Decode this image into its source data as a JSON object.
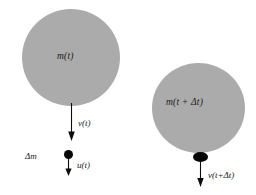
{
  "diagram": {
    "background_color": "#ffffff",
    "body_color": "#ababab",
    "mass_color": "#060606",
    "arrow_color": "#0d0d0d",
    "before": {
      "body_label": "m(t)",
      "velocity_label": "v(t)",
      "ejected_mass_label": "Δm",
      "ejected_velocity_label": "u(t)"
    },
    "after": {
      "body_label": "m(t + Δt)",
      "velocity_label": "v(t+Δt)"
    }
  }
}
